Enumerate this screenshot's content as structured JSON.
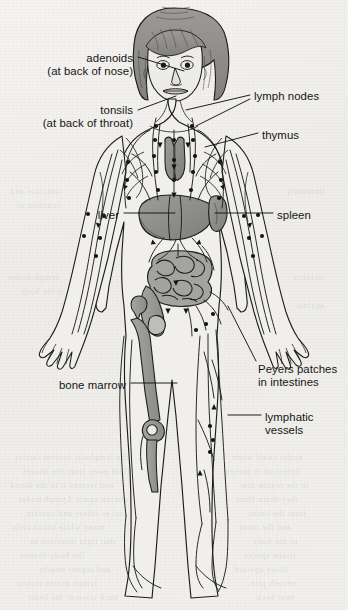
{
  "figure": {
    "title": "The lymphatic system",
    "background_color": "#f2f1ef",
    "ink_color": "#1a1a1a",
    "organ_fill_color": "#8d8d8b",
    "organ_fill_light": "#aaaaa6",
    "hair_fill_color": "#8e8d8a",
    "skin_fill_color": "#ebeae6"
  },
  "labels": [
    {
      "id": "adenoids",
      "line1": "adenoids",
      "line2": "(at back of nose)",
      "align": "right",
      "x": 133,
      "y": 52
    },
    {
      "id": "tonsils",
      "line1": "tonsils",
      "line2": "(at back of throat)",
      "align": "right",
      "x": 133,
      "y": 104
    },
    {
      "id": "lymph-nodes",
      "line1": "lymph nodes",
      "line2": "",
      "align": "left",
      "x": 254,
      "y": 90
    },
    {
      "id": "thymus",
      "line1": "thymus",
      "line2": "",
      "align": "left",
      "x": 262,
      "y": 129
    },
    {
      "id": "liver",
      "line1": "liver",
      "line2": "",
      "align": "right",
      "x": 119,
      "y": 209
    },
    {
      "id": "spleen",
      "line1": "spleen",
      "line2": "",
      "align": "left",
      "x": 277,
      "y": 209
    },
    {
      "id": "peyers-patches",
      "line1": "Peyers patches",
      "line2": "in intestines",
      "align": "left",
      "x": 258,
      "y": 363
    },
    {
      "id": "bone-marrow",
      "line1": "bone marrow",
      "line2": "",
      "align": "right",
      "x": 126,
      "y": 379
    },
    {
      "id": "lymphatic-vessels",
      "line1": "lymphatic",
      "line2": "vessels",
      "align": "left",
      "x": 265,
      "y": 411
    }
  ],
  "leader_lines": [
    {
      "id": "adenoids-leader",
      "x1": 138,
      "y1": 57,
      "x2": 184,
      "y2": 71
    },
    {
      "id": "tonsils-leader",
      "x1": 138,
      "y1": 110,
      "x2": 176,
      "y2": 96
    },
    {
      "id": "lymph-nodes-leader-upper",
      "x1": 250,
      "y1": 95,
      "x2": 186,
      "y2": 110
    },
    {
      "id": "lymph-nodes-leader-lower",
      "x1": 250,
      "y1": 99,
      "x2": 196,
      "y2": 126
    },
    {
      "id": "thymus-leader",
      "x1": 258,
      "y1": 133,
      "x2": 205,
      "y2": 147
    },
    {
      "id": "liver-leader",
      "x1": 124,
      "y1": 213,
      "x2": 175,
      "y2": 213
    },
    {
      "id": "spleen-leader",
      "x1": 273,
      "y1": 213,
      "x2": 215,
      "y2": 213
    },
    {
      "id": "peyers-leader",
      "x1": 256,
      "y1": 361,
      "x2": 228,
      "y2": 306
    },
    {
      "id": "bone-marrow-leader",
      "x1": 131,
      "y1": 383,
      "x2": 177,
      "y2": 383
    },
    {
      "id": "lymphatic-vessels-leader",
      "x1": 261,
      "y1": 415,
      "x2": 228,
      "y2": 415
    }
  ],
  "show_through_text": [
    {
      "text": "the lymphatic system carries",
      "x": 14,
      "y": 452
    },
    {
      "text": "fluid away from the tissues",
      "x": 22,
      "y": 466
    },
    {
      "text": "and returns it to the blood",
      "x": 10,
      "y": 480
    },
    {
      "text": "circulation again. Lymph nodes",
      "x": 18,
      "y": 494
    },
    {
      "text": "act as filters and contain",
      "x": 26,
      "y": 508
    },
    {
      "text": "many white blood cells",
      "x": 12,
      "y": 522
    },
    {
      "text": "that fight infection in",
      "x": 30,
      "y": 536
    },
    {
      "text": "the body tissues",
      "x": 20,
      "y": 550
    },
    {
      "text": "and organs nearby",
      "x": 38,
      "y": 564
    },
    {
      "text": "lymph drains slowly",
      "x": 16,
      "y": 578
    },
    {
      "text": "back towards the heart",
      "x": 28,
      "y": 592
    },
    {
      "text": "nodes swell when",
      "x": 232,
      "y": 452
    },
    {
      "text": "infection is present",
      "x": 222,
      "y": 466
    },
    {
      "text": "in the region that",
      "x": 240,
      "y": 480
    },
    {
      "text": "they drain fluid",
      "x": 236,
      "y": 494
    },
    {
      "text": "from the limbs",
      "x": 248,
      "y": 508
    },
    {
      "text": "and the trunk",
      "x": 238,
      "y": 522
    },
    {
      "text": "of the body",
      "x": 252,
      "y": 536
    },
    {
      "text": "tissue spaces",
      "x": 244,
      "y": 550
    },
    {
      "text": "flows upward",
      "x": 234,
      "y": 564
    },
    {
      "text": "vessels join",
      "x": 250,
      "y": 578
    },
    {
      "text": "near neck",
      "x": 256,
      "y": 592
    },
    {
      "text": "structure and",
      "x": 10,
      "y": 186
    },
    {
      "text": "function of",
      "x": 16,
      "y": 200
    },
    {
      "text": "lymph nodes",
      "x": 8,
      "y": 272
    },
    {
      "text": "in the body",
      "x": 20,
      "y": 286
    },
    {
      "text": "immunity",
      "x": 286,
      "y": 186
    },
    {
      "text": "defence",
      "x": 292,
      "y": 272
    },
    {
      "text": "against",
      "x": 296,
      "y": 300
    }
  ]
}
